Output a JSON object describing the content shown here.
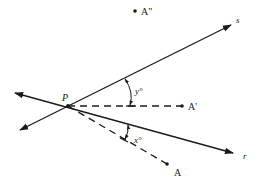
{
  "diagram": {
    "type": "geometry-reflection",
    "colors": {
      "stroke": "#1a1a1a",
      "background": "#ffffff"
    },
    "points": {
      "P": {
        "label": "P",
        "x": 68,
        "y": 106
      },
      "A": {
        "label": "A",
        "x": 167,
        "y": 164
      },
      "A_prime": {
        "label": "A'",
        "x": 182,
        "y": 106
      },
      "A_double_prime": {
        "label": "A\"",
        "x": 135,
        "y": 11
      }
    },
    "lines": {
      "s": {
        "label": "s"
      },
      "r": {
        "label": "r"
      }
    },
    "angles": {
      "x": {
        "label": "x°"
      },
      "y": {
        "label": "y°"
      }
    }
  }
}
